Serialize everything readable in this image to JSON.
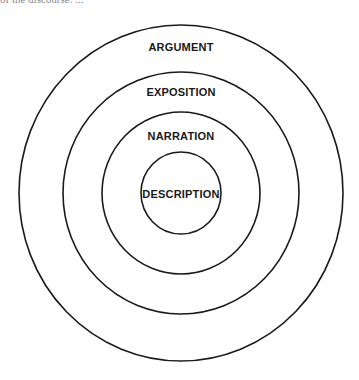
{
  "diagram": {
    "type": "concentric-circles",
    "top_cut_text": "of the discourse: ...",
    "stroke_color": "#1a1a1a",
    "background": "#ffffff",
    "rings": [
      {
        "label": "ARGUMENT",
        "cx": 181,
        "cy": 193,
        "rx": 162,
        "ry": 168,
        "label_y": 51
      },
      {
        "label": "EXPOSITION",
        "cx": 181,
        "cy": 193,
        "rx": 118,
        "ry": 121,
        "label_y": 96
      },
      {
        "label": "NARRATION",
        "cx": 181,
        "cy": 193,
        "rx": 79,
        "ry": 81,
        "label_y": 140
      },
      {
        "label": "DESCRIPTION",
        "cx": 181,
        "cy": 193,
        "rx": 40,
        "ry": 41,
        "label_y": 198
      }
    ]
  }
}
